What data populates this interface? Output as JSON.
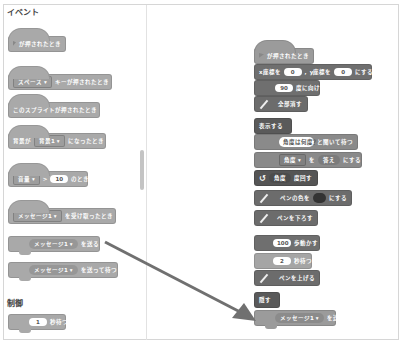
{
  "palette": {
    "heading_events": "イベント",
    "heading_control": "制御",
    "blocks": [
      {
        "id": "when_flag",
        "text": "が押されたとき"
      },
      {
        "id": "when_key",
        "dropdown": "スペース ▾",
        "text": "キーが押されたとき"
      },
      {
        "id": "when_sprite",
        "text": "このスプライトが押されたとき"
      },
      {
        "id": "when_backdrop",
        "prefix": "背景が",
        "dropdown": "背景1 ▾",
        "text": "になったとき"
      },
      {
        "id": "when_greater",
        "dropdown": "音量 ▾",
        "op": ">",
        "value": "10",
        "text": "のとき"
      },
      {
        "id": "when_receive",
        "dropdown": "メッセージ1 ▾",
        "text": "を受け取ったとき"
      },
      {
        "id": "broadcast",
        "dropdown": "メッセージ1 ▾",
        "text": "を送る"
      },
      {
        "id": "broadcast_wait",
        "dropdown": "メッセージ1 ▾",
        "text": "を送って待つ"
      },
      {
        "id": "wait",
        "value": "1",
        "text": "秒待つ"
      }
    ]
  },
  "script": {
    "blocks": [
      {
        "id": "s_flag",
        "text": "が押されたとき"
      },
      {
        "id": "s_goto",
        "x_label": "x座標を",
        "x_value": "0",
        "sep": ",",
        "y_label": "y座標を",
        "y_value": "0",
        "text": "にする"
      },
      {
        "id": "s_point",
        "value": "90",
        "text": "度に向ける"
      },
      {
        "id": "s_erase",
        "text": "全部消す"
      },
      {
        "id": "s_show",
        "text": "表示する"
      },
      {
        "id": "s_ask",
        "value": "角度は何度？",
        "text": "と聞いて待つ"
      },
      {
        "id": "s_setvar",
        "dropdown": "角度 ▾",
        "mid": "を",
        "reporter": "答え",
        "text": "にする"
      },
      {
        "id": "s_turn",
        "reporter": "角度",
        "text": "度回す"
      },
      {
        "id": "s_pencolor",
        "prefix": "ペンの色を",
        "text": "にする",
        "color": "#333333"
      },
      {
        "id": "s_pendown",
        "text": "ペンを下ろす"
      },
      {
        "id": "s_move",
        "value": "100",
        "text": "歩動かす"
      },
      {
        "id": "s_wait",
        "value": "2",
        "text": "秒待つ"
      },
      {
        "id": "s_penup",
        "text": "ペンを上げる"
      },
      {
        "id": "s_hide",
        "text": "隠す"
      },
      {
        "id": "s_broadcast",
        "dropdown": "メッセージ1 ▾",
        "text": "を送る"
      }
    ]
  },
  "arrow": {
    "from": [
      105,
      242
    ],
    "to": [
      255,
      320
    ],
    "color": "#707070"
  }
}
